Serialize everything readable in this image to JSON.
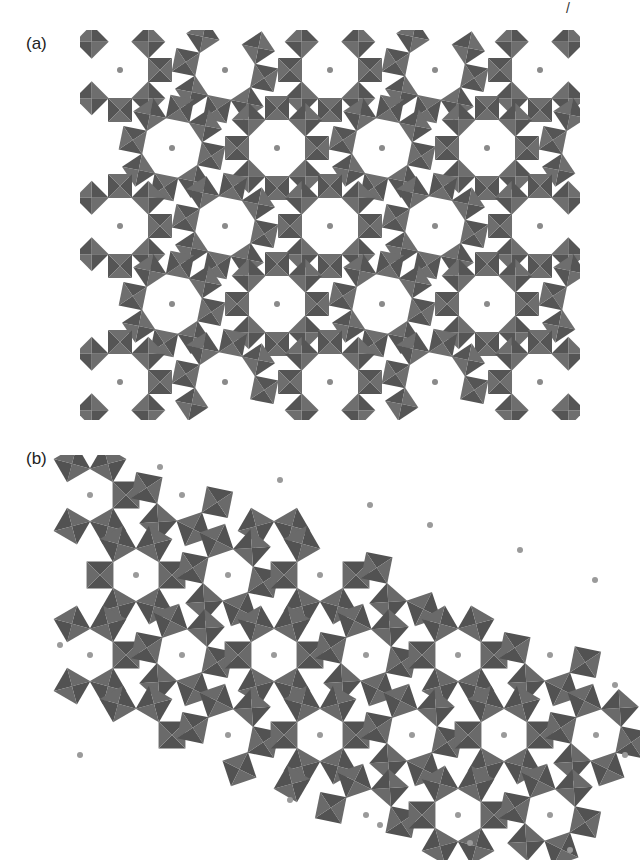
{
  "page": {
    "corner_mark": "/"
  },
  "figure": {
    "panels": [
      {
        "label": "(a)",
        "description": "Polyhedral framework projection with octagonal and hexagonal channels containing small cations",
        "polyhedron_color": "#555555",
        "face_light": "#6e6e6e",
        "channel_color": "#ffffff",
        "atom_color": "#8a8a8a"
      },
      {
        "label": "(b)",
        "description": "Polyhedral framework projection with hexagonal rings of octahedra and isolated cations",
        "polyhedron_color": "#525252",
        "face_light": "#6a6a6a",
        "channel_color": "#ffffff",
        "atom_color": "#9a9a9a"
      }
    ]
  }
}
